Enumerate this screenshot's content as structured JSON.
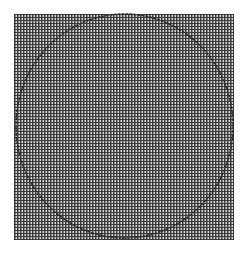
{
  "figure": {
    "background": "#ffffff",
    "grid": {
      "x": 14,
      "y": 14,
      "width": 220,
      "height": 226,
      "pitch_px": 3,
      "dark_line": "#3a3a3a",
      "light_line": "#d8d8d8",
      "fill": "#8a8a8a"
    },
    "circle": {
      "cx": 124.5,
      "cy": 126,
      "rx": 108.5,
      "ry": 112,
      "stroke": "#2a2a2a",
      "stroke_width": 1.5,
      "dashed": true
    }
  }
}
